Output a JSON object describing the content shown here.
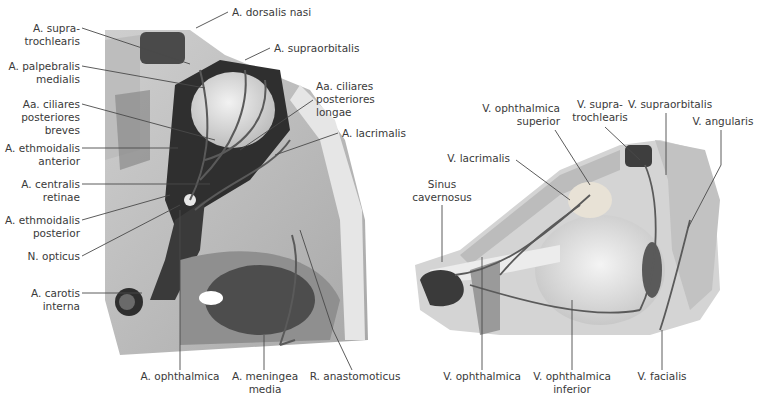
{
  "figures": [
    {
      "id": "left",
      "subject": "Arteries of the orbit, superior view",
      "labels": [
        {
          "text": "A. supra-\ntrochlearis"
        },
        {
          "text": "A. palpebralis\nmedialis"
        },
        {
          "text": "Aa. ciliares\nposteriores\nbreves"
        },
        {
          "text": "A. ethmoidalis\nanterior"
        },
        {
          "text": "A. centralis\nretinae"
        },
        {
          "text": "A. ethmoidalis\nposterior"
        },
        {
          "text": "N. opticus"
        },
        {
          "text": "A. carotis\ninterna"
        },
        {
          "text": "A. dorsalis nasi"
        },
        {
          "text": "A. supraorbitalis"
        },
        {
          "text": "Aa. ciliares\nposteriores\nlongae"
        },
        {
          "text": "A. lacrimalis"
        },
        {
          "text": "A. ophthalmica"
        },
        {
          "text": "A. meningea\nmedia"
        },
        {
          "text": "R. anastomoticus"
        }
      ]
    },
    {
      "id": "right",
      "subject": "Veins of the orbit, lateral view",
      "labels": [
        {
          "text": "V. supra-\ntrochlearis"
        },
        {
          "text": "V. supraorbitalis"
        },
        {
          "text": "V. angularis"
        },
        {
          "text": "V. ophthalmica\nsuperior"
        },
        {
          "text": "V. lacrimalis"
        },
        {
          "text": "Sinus\ncavernosus"
        },
        {
          "text": "V. ophthalmica"
        },
        {
          "text": "V. ophthalmica\ninferior"
        },
        {
          "text": "V. facialis"
        }
      ]
    }
  ],
  "colors": {
    "leader": "#4a4a4a",
    "text": "#3a3a3a",
    "bone": "#d9d9d9",
    "vessel": "#5a5a5a"
  }
}
